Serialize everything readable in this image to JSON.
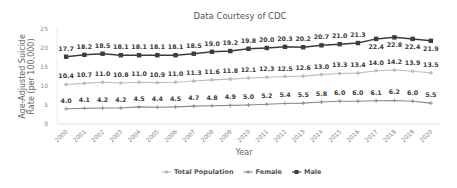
{
  "chart_data": {
    "type": "line",
    "title": "Data Courtesy of CDC",
    "xlabel": "Year",
    "ylabel": "Age-Adjusted Suicide Rate (per 100,000)",
    "ylabel_lines": [
      "Age-Adjusted Suicide",
      "Rate (per 100,000)"
    ],
    "ylim": [
      0,
      25
    ],
    "yticks": [
      "0",
      "5",
      "10",
      "15",
      "20",
      "25"
    ],
    "grid": false,
    "legend_position": "bottom",
    "x": [
      "2000",
      "2001",
      "2002",
      "2003",
      "2004",
      "2005",
      "2006",
      "2007",
      "2008",
      "2009",
      "2010",
      "2011",
      "2012",
      "2013",
      "2014",
      "2015",
      "2016",
      "2017",
      "2018",
      "2019",
      "2020"
    ],
    "series": [
      {
        "name": "Total Population",
        "color": "#bdbdbd",
        "marker": "circle",
        "values": [
          10.4,
          10.7,
          11.0,
          10.8,
          11.0,
          10.9,
          11.0,
          11.3,
          11.6,
          11.8,
          12.1,
          12.3,
          12.5,
          12.6,
          13.0,
          13.3,
          13.4,
          14.0,
          14.2,
          13.9,
          13.5
        ]
      },
      {
        "name": "Female",
        "color": "#8a8a8a",
        "marker": "plus",
        "values": [
          4.0,
          4.1,
          4.2,
          4.2,
          4.5,
          4.4,
          4.5,
          4.7,
          4.8,
          4.9,
          5.0,
          5.2,
          5.4,
          5.5,
          5.8,
          6.0,
          6.0,
          6.1,
          6.2,
          6.0,
          5.5
        ]
      },
      {
        "name": "Male",
        "color": "#3c3c3c",
        "marker": "square",
        "values": [
          17.7,
          18.2,
          18.5,
          18.1,
          18.1,
          18.1,
          18.1,
          18.5,
          19.0,
          19.2,
          19.8,
          20.0,
          20.3,
          20.2,
          20.7,
          21.0,
          21.3,
          22.4,
          22.8,
          22.4,
          21.9
        ]
      }
    ]
  }
}
